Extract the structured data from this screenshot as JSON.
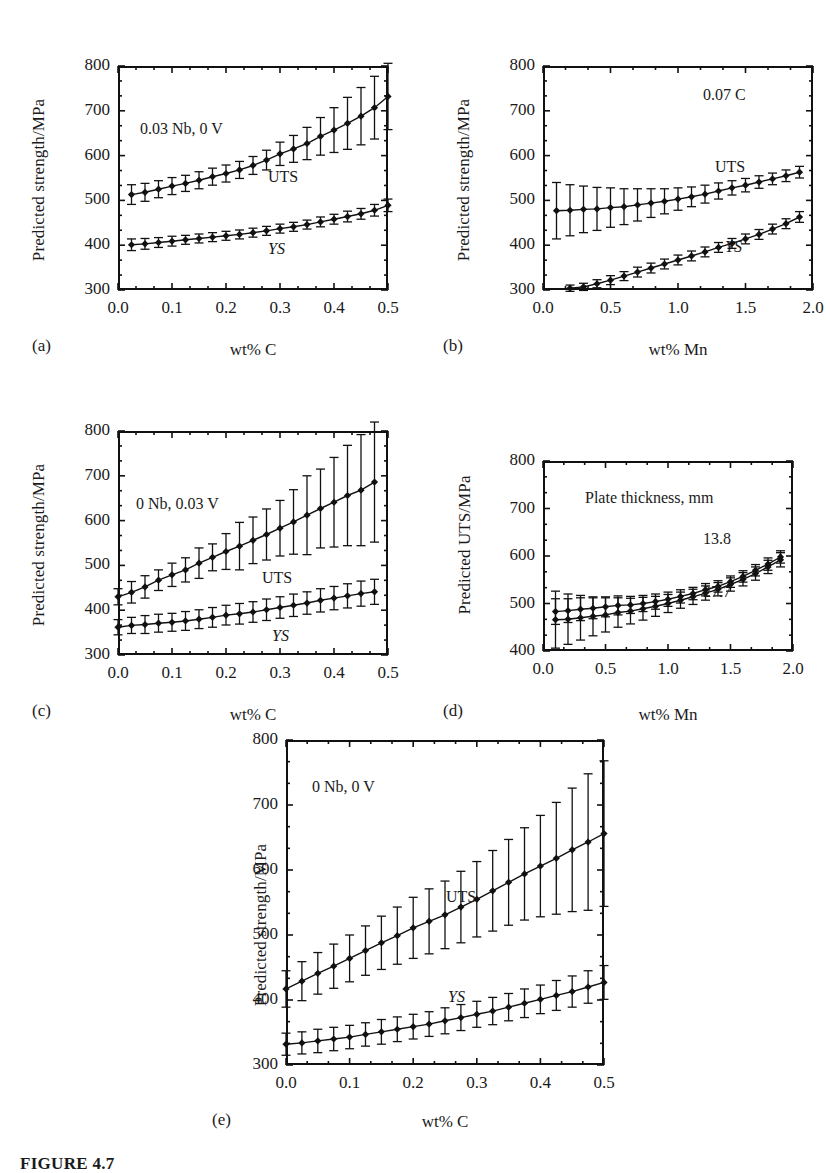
{
  "figure": {
    "caption_fragment": "FIGURE 4.7"
  },
  "panels": [
    {
      "key": "a",
      "label": "(a)",
      "ylabel": "Predicted strength/MPa",
      "xlabel": "wt% C",
      "annotation": "0.03 Nb, 0 V",
      "series_labels": [
        {
          "text": "UTS",
          "italic": false
        },
        {
          "text": "YS",
          "italic": true
        }
      ],
      "yticks": [
        "300",
        "400",
        "500",
        "600",
        "700",
        "800"
      ],
      "xticks": [
        "0.0",
        "0.1",
        "0.2",
        "0.3",
        "0.4",
        "0.5"
      ]
    },
    {
      "key": "b",
      "label": "(b)",
      "ylabel": "Predicted strength/MPa",
      "xlabel": "wt% Mn",
      "annotation": "0.07 C",
      "series_labels": [
        {
          "text": "UTS",
          "italic": false
        },
        {
          "text": "YS",
          "italic": true
        }
      ],
      "yticks": [
        "300",
        "400",
        "500",
        "600",
        "700",
        "800"
      ],
      "xticks": [
        "0.0",
        "0.5",
        "1.0",
        "1.5",
        "2.0"
      ]
    },
    {
      "key": "c",
      "label": "(c)",
      "ylabel": "Predicted strength/MPa",
      "xlabel": "wt% C",
      "annotation": "0 Nb, 0.03 V",
      "series_labels": [
        {
          "text": "UTS",
          "italic": false
        },
        {
          "text": "YS",
          "italic": true
        }
      ],
      "yticks": [
        "300",
        "400",
        "500",
        "600",
        "700",
        "800"
      ],
      "xticks": [
        "0.0",
        "0.1",
        "0.2",
        "0.3",
        "0.4",
        "0.5"
      ]
    },
    {
      "key": "d",
      "label": "(d)",
      "ylabel": "Predicted UTS/MPa",
      "xlabel": "wt% Mn",
      "annotation": "Plate thickness, mm",
      "series_labels": [
        {
          "text": "13.8",
          "italic": false
        },
        {
          "text": "27.7",
          "italic": false
        }
      ],
      "yticks": [
        "400",
        "500",
        "600",
        "700",
        "800"
      ],
      "xticks": [
        "0.0",
        "0.5",
        "1.0",
        "1.5",
        "2.0"
      ]
    },
    {
      "key": "e",
      "label": "(e)",
      "ylabel": "Predicted strength/MPa",
      "xlabel": "wt% C",
      "annotation": "0 Nb, 0 V",
      "series_labels": [
        {
          "text": "UTS",
          "italic": false
        },
        {
          "text": "YS",
          "italic": true
        }
      ],
      "yticks": [
        "300",
        "400",
        "500",
        "600",
        "700",
        "800"
      ],
      "xticks": [
        "0.0",
        "0.1",
        "0.2",
        "0.3",
        "0.4",
        "0.5"
      ]
    }
  ],
  "chart_data": [
    {
      "id": "a",
      "type": "scatter",
      "title": "",
      "xlabel": "wt% C",
      "ylabel": "Predicted strength/MPa",
      "annotation": "0.03 Nb, 0 V",
      "xlim": [
        0.0,
        0.5
      ],
      "ylim": [
        300,
        800
      ],
      "grid": false,
      "errorbars": true,
      "legend_position": "inline",
      "series": [
        {
          "name": "UTS",
          "x": [
            0.025,
            0.05,
            0.075,
            0.1,
            0.125,
            0.15,
            0.175,
            0.2,
            0.225,
            0.25,
            0.275,
            0.3,
            0.325,
            0.35,
            0.375,
            0.4,
            0.425,
            0.45,
            0.475,
            0.5
          ],
          "values": [
            513,
            518,
            525,
            532,
            538,
            545,
            553,
            560,
            568,
            578,
            590,
            604,
            615,
            627,
            643,
            657,
            672,
            688,
            707,
            732
          ],
          "errors": [
            22,
            20,
            19,
            19,
            18,
            19,
            19,
            19,
            19,
            20,
            22,
            26,
            30,
            36,
            42,
            50,
            58,
            64,
            70,
            74
          ]
        },
        {
          "name": "YS",
          "x": [
            0.025,
            0.05,
            0.075,
            0.1,
            0.125,
            0.15,
            0.175,
            0.2,
            0.225,
            0.25,
            0.275,
            0.3,
            0.325,
            0.35,
            0.375,
            0.4,
            0.425,
            0.45,
            0.475,
            0.5
          ],
          "values": [
            401,
            403,
            406,
            409,
            412,
            415,
            418,
            421,
            424,
            428,
            432,
            437,
            441,
            446,
            452,
            458,
            464,
            470,
            478,
            489
          ],
          "errors": [
            13,
            12,
            11,
            11,
            10,
            10,
            10,
            10,
            10,
            10,
            10,
            10,
            10,
            10,
            11,
            11,
            12,
            12,
            13,
            14
          ]
        }
      ]
    },
    {
      "id": "b",
      "type": "scatter",
      "title": "",
      "xlabel": "wt% Mn",
      "ylabel": "Predicted strength/MPa",
      "annotation": "0.07 C",
      "xlim": [
        0.0,
        2.0
      ],
      "ylim": [
        300,
        800
      ],
      "grid": false,
      "errorbars": true,
      "legend_position": "inline",
      "series": [
        {
          "name": "UTS",
          "x": [
            0.1,
            0.2,
            0.3,
            0.4,
            0.5,
            0.6,
            0.7,
            0.8,
            0.9,
            1.0,
            1.1,
            1.2,
            1.3,
            1.4,
            1.5,
            1.6,
            1.7,
            1.8,
            1.9
          ],
          "values": [
            477,
            478,
            480,
            481,
            484,
            486,
            490,
            494,
            498,
            503,
            508,
            514,
            521,
            528,
            534,
            541,
            548,
            555,
            563
          ],
          "errors": [
            63,
            57,
            52,
            48,
            44,
            40,
            36,
            32,
            28,
            25,
            22,
            20,
            18,
            16,
            15,
            14,
            13,
            13,
            13
          ]
        },
        {
          "name": "YS",
          "x": [
            0.2,
            0.3,
            0.4,
            0.5,
            0.6,
            0.7,
            0.8,
            0.9,
            1.0,
            1.1,
            1.2,
            1.3,
            1.4,
            1.5,
            1.6,
            1.7,
            1.8,
            1.9
          ],
          "values": [
            304,
            307,
            314,
            322,
            331,
            340,
            349,
            358,
            367,
            376,
            385,
            395,
            404,
            414,
            424,
            436,
            448,
            463
          ],
          "errors": [
            7,
            8,
            9,
            10,
            10,
            11,
            11,
            11,
            11,
            11,
            11,
            11,
            11,
            11,
            11,
            11,
            11,
            12
          ]
        }
      ]
    },
    {
      "id": "c",
      "type": "scatter",
      "title": "",
      "xlabel": "wt% C",
      "ylabel": "Predicted strength/MPa",
      "annotation": "0 Nb, 0.03 V",
      "xlim": [
        0.0,
        0.5
      ],
      "ylim": [
        300,
        800
      ],
      "grid": false,
      "errorbars": true,
      "legend_position": "inline",
      "series": [
        {
          "name": "UTS",
          "x": [
            0.0,
            0.025,
            0.05,
            0.075,
            0.1,
            0.125,
            0.15,
            0.175,
            0.2,
            0.225,
            0.25,
            0.275,
            0.3,
            0.325,
            0.35,
            0.375,
            0.4,
            0.425,
            0.45,
            0.475
          ],
          "values": [
            430,
            440,
            452,
            467,
            479,
            490,
            505,
            518,
            531,
            543,
            556,
            569,
            583,
            597,
            612,
            627,
            641,
            656,
            668,
            686
          ],
          "errors": [
            18,
            24,
            25,
            23,
            26,
            27,
            34,
            30,
            40,
            53,
            52,
            57,
            62,
            72,
            88,
            88,
            100,
            112,
            124,
            134
          ]
        },
        {
          "name": "YS",
          "x": [
            0.0,
            0.025,
            0.05,
            0.075,
            0.1,
            0.125,
            0.15,
            0.175,
            0.2,
            0.225,
            0.25,
            0.275,
            0.3,
            0.325,
            0.35,
            0.375,
            0.4,
            0.425,
            0.45,
            0.475
          ],
          "values": [
            362,
            366,
            368,
            371,
            373,
            376,
            380,
            384,
            389,
            392,
            396,
            401,
            406,
            411,
            416,
            422,
            427,
            432,
            437,
            441
          ],
          "errors": [
            17,
            18,
            20,
            20,
            20,
            21,
            21,
            22,
            22,
            23,
            23,
            24,
            24,
            25,
            25,
            26,
            26,
            27,
            28,
            28
          ]
        }
      ]
    },
    {
      "id": "d",
      "type": "scatter",
      "title": "",
      "xlabel": "wt% Mn",
      "ylabel": "Predicted UTS/MPa",
      "annotation": "Plate thickness, mm",
      "xlim": [
        0.0,
        2.0
      ],
      "ylim": [
        400,
        800
      ],
      "grid": false,
      "errorbars": true,
      "legend_position": "inline",
      "series": [
        {
          "name": "13.8",
          "x": [
            0.1,
            0.2,
            0.3,
            0.4,
            0.5,
            0.6,
            0.7,
            0.8,
            0.9,
            1.0,
            1.1,
            1.2,
            1.3,
            1.4,
            1.5,
            1.6,
            1.7,
            1.8,
            1.9
          ],
          "values": [
            483,
            485,
            488,
            490,
            493,
            496,
            497,
            500,
            504,
            509,
            515,
            521,
            529,
            536,
            546,
            557,
            570,
            583,
            598
          ],
          "errors": [
            27,
            25,
            24,
            22,
            21,
            20,
            18,
            17,
            16,
            15,
            14,
            13,
            13,
            12,
            12,
            12,
            12,
            13,
            13
          ]
        },
        {
          "name": "27.7",
          "x": [
            0.1,
            0.2,
            0.3,
            0.4,
            0.5,
            0.6,
            0.7,
            0.8,
            0.9,
            1.0,
            1.1,
            1.2,
            1.3,
            1.4,
            1.5,
            1.6,
            1.7,
            1.8,
            1.9
          ],
          "values": [
            466,
            467,
            470,
            473,
            476,
            481,
            484,
            489,
            494,
            500,
            507,
            514,
            522,
            530,
            540,
            551,
            563,
            577,
            592
          ],
          "errors": [
            60,
            53,
            47,
            41,
            36,
            31,
            27,
            24,
            21,
            19,
            17,
            16,
            15,
            14,
            14,
            14,
            14,
            14,
            15
          ]
        }
      ]
    },
    {
      "id": "e",
      "type": "scatter",
      "title": "",
      "xlabel": "wt% C",
      "ylabel": "Predicted strength/MPa",
      "annotation": "0 Nb, 0 V",
      "xlim": [
        0.0,
        0.5
      ],
      "ylim": [
        300,
        800
      ],
      "grid": false,
      "errorbars": true,
      "legend_position": "inline",
      "series": [
        {
          "name": "UTS",
          "x": [
            0.0,
            0.025,
            0.05,
            0.075,
            0.1,
            0.125,
            0.15,
            0.175,
            0.2,
            0.225,
            0.25,
            0.275,
            0.3,
            0.325,
            0.35,
            0.375,
            0.4,
            0.425,
            0.45,
            0.475,
            0.5
          ],
          "values": [
            417,
            429,
            441,
            452,
            464,
            476,
            488,
            499,
            511,
            521,
            531,
            543,
            555,
            568,
            581,
            594,
            606,
            618,
            631,
            643,
            656
          ],
          "errors": [
            28,
            30,
            32,
            34,
            36,
            38,
            41,
            44,
            47,
            50,
            52,
            55,
            58,
            62,
            66,
            71,
            78,
            86,
            95,
            105,
            112
          ]
        },
        {
          "name": "YS",
          "x": [
            0.0,
            0.025,
            0.05,
            0.075,
            0.1,
            0.125,
            0.15,
            0.175,
            0.2,
            0.225,
            0.25,
            0.275,
            0.3,
            0.325,
            0.35,
            0.375,
            0.4,
            0.425,
            0.45,
            0.475,
            0.5
          ],
          "values": [
            332,
            334,
            337,
            340,
            343,
            347,
            351,
            355,
            359,
            363,
            368,
            373,
            378,
            383,
            389,
            395,
            401,
            407,
            413,
            420,
            427
          ],
          "errors": [
            17,
            17,
            18,
            18,
            18,
            18,
            19,
            19,
            19,
            19,
            20,
            20,
            20,
            21,
            21,
            22,
            22,
            23,
            24,
            25,
            26
          ]
        }
      ]
    }
  ]
}
